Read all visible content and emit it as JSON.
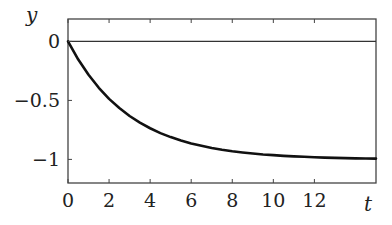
{
  "chart_data": {
    "type": "line",
    "title": "",
    "xlabel": "t",
    "ylabel": "y",
    "xlim": [
      0,
      15
    ],
    "ylim": [
      -1.2,
      0.19
    ],
    "grid": false,
    "legend": null,
    "x_ticks": [
      0,
      2,
      4,
      6,
      8,
      10,
      12
    ],
    "x_tick_labels": [
      "0",
      "2",
      "4",
      "6",
      "8",
      "10",
      "12"
    ],
    "y_ticks": [
      0,
      -0.5,
      -1
    ],
    "y_tick_labels": [
      "0",
      "−0.5",
      "−1"
    ],
    "reference_lines": [
      {
        "orientation": "horizontal",
        "y": 0,
        "color": "#333333"
      }
    ],
    "series": [
      {
        "name": "y(t)",
        "color": "#111111",
        "line_width": 2.6,
        "x": [
          0,
          0.5,
          1,
          1.5,
          2,
          2.5,
          3,
          3.5,
          4,
          4.5,
          5,
          5.5,
          6,
          6.5,
          7,
          7.5,
          8,
          8.5,
          9,
          9.5,
          10,
          10.5,
          11,
          11.5,
          12,
          12.5,
          13,
          13.5,
          14,
          14.5,
          15
        ],
        "values": [
          0,
          -0.154,
          -0.283,
          -0.393,
          -0.487,
          -0.565,
          -0.632,
          -0.689,
          -0.736,
          -0.777,
          -0.811,
          -0.84,
          -0.865,
          -0.885,
          -0.903,
          -0.918,
          -0.931,
          -0.941,
          -0.95,
          -0.958,
          -0.964,
          -0.97,
          -0.974,
          -0.978,
          -0.982,
          -0.985,
          -0.987,
          -0.989,
          -0.991,
          -0.992,
          -0.993
        ]
      }
    ]
  },
  "labels": {
    "x_axis": "t",
    "y_axis": "y"
  }
}
